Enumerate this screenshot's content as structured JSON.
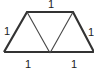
{
  "diagram": {
    "shape": "trapezoid divided into three equilateral triangles",
    "colors": {
      "stroke": "#333333",
      "background": "#ffffff",
      "text": "#222222"
    },
    "vertices": {
      "top_left": [
        27,
        12
      ],
      "top_right": [
        73,
        12
      ],
      "bottom_left": [
        4,
        52
      ],
      "bottom_mid": [
        50,
        53
      ],
      "bottom_right": [
        94,
        52
      ]
    },
    "labels": {
      "top": "1",
      "left": "1",
      "right": "1",
      "bottom_left": "1",
      "bottom_right": "1"
    }
  }
}
